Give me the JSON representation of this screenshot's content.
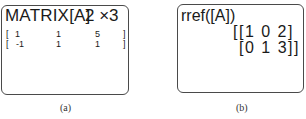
{
  "panels": [
    {
      "caption": "(a)",
      "title": "MATRIX[A]",
      "dimensions": "2 ×3",
      "matrix": {
        "rows": [
          {
            "open": "[",
            "cells": [
              "1",
              "1",
              "5"
            ],
            "close": "]"
          },
          {
            "open": "[",
            "cells": [
              "-1",
              "1",
              "1"
            ],
            "close": "]"
          }
        ]
      }
    },
    {
      "caption": "(b)",
      "command": "rref([A])",
      "result_lines": [
        "[[1 0 2]",
        "[0 1 3]]"
      ],
      "result_matrix": [
        [
          1,
          0,
          2
        ],
        [
          0,
          1,
          3
        ]
      ]
    }
  ]
}
